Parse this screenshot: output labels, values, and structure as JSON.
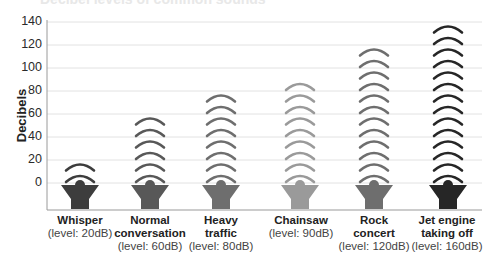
{
  "chart_data": {
    "type": "bar",
    "title": "Decibel levels of common sounds",
    "xlabel": "",
    "ylabel": "Decibels",
    "ylim": [
      0,
      140
    ],
    "yticks": [
      0,
      20,
      40,
      60,
      80,
      100,
      120,
      140
    ],
    "grid": true,
    "categories": [
      "Whisper",
      "Normal conversation",
      "Heavy traffic",
      "Chainsaw",
      "Rock concert",
      "Jet engine taking off"
    ],
    "values": [
      20,
      60,
      80,
      90,
      120,
      160
    ],
    "arc_counts": [
      2,
      6,
      8,
      9,
      12,
      14
    ],
    "level_labels": [
      "(level: 20dB)",
      "(level: 60dB)",
      "(level: 80dB)",
      "(level: 90dB)",
      "(level: 120dB)",
      "(level: 160dB)"
    ],
    "colors": [
      "#3d3d3d",
      "#585858",
      "#6e6e6e",
      "#9a9a9a",
      "#6e6e6e",
      "#262626"
    ],
    "legend": null
  },
  "axis": {
    "ylabel": "Decibels",
    "ticks": [
      "0",
      "20",
      "40",
      "60",
      "80",
      "100",
      "120",
      "140"
    ]
  },
  "categories": [
    {
      "name_lines": [
        "Whisper"
      ],
      "level": "(level: 20dB)"
    },
    {
      "name_lines": [
        "Normal",
        "conversation"
      ],
      "level": "(level: 60dB)"
    },
    {
      "name_lines": [
        "Heavy",
        "traffic"
      ],
      "level": "(level: 80dB)"
    },
    {
      "name_lines": [
        "Chainsaw"
      ],
      "level": "(level: 90dB)"
    },
    {
      "name_lines": [
        "Rock",
        "concert"
      ],
      "level": "(level: 120dB)"
    },
    {
      "name_lines": [
        "Jet engine",
        "taking off"
      ],
      "level": "(level: 160dB)"
    }
  ]
}
